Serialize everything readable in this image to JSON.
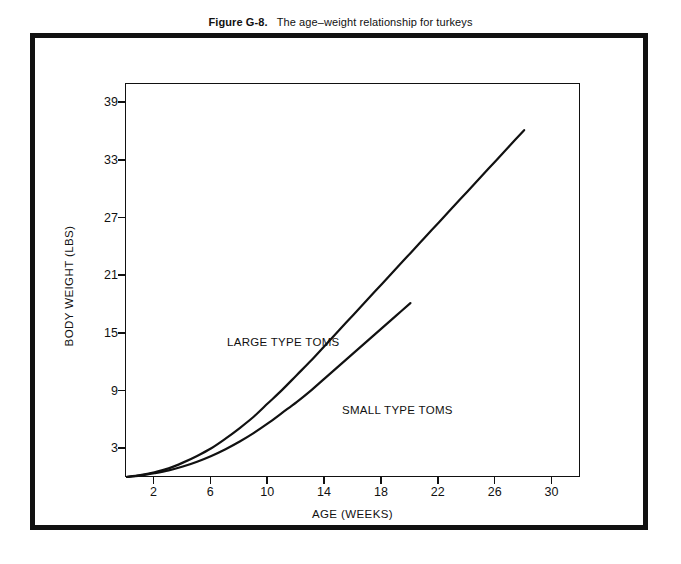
{
  "figure": {
    "number": "Figure G-8.",
    "caption": "The age–weight relationship for turkeys"
  },
  "chart_data": {
    "type": "line",
    "xlabel": "AGE (WEEKS)",
    "ylabel": "BODY WEIGHT (LBS)",
    "xlim": [
      0,
      32
    ],
    "ylim": [
      0,
      41
    ],
    "xticks": [
      2,
      6,
      10,
      14,
      18,
      22,
      26,
      30
    ],
    "yticks": [
      3,
      9,
      15,
      21,
      27,
      33,
      39
    ],
    "xtick_labels": [
      "2",
      "6",
      "10",
      "14",
      "18",
      "22",
      "26",
      "30"
    ],
    "ytick_labels": [
      "3",
      "9",
      "15",
      "21",
      "27",
      "33",
      "39"
    ],
    "grid": false,
    "legend": "inline-annotations",
    "line_color": "#111111",
    "background": "#ffffff",
    "series": [
      {
        "name": "LARGE TYPE TOMS",
        "annotation_label": "LARGE TYPE TOMS",
        "x": [
          0,
          1,
          2,
          3,
          4,
          5,
          6,
          7,
          8,
          9,
          10,
          11,
          12,
          13,
          14,
          15,
          16,
          17,
          18,
          19,
          20,
          21,
          22,
          23,
          24,
          25,
          26,
          27,
          28
        ],
        "values": [
          0.1,
          0.3,
          0.6,
          1.0,
          1.6,
          2.3,
          3.1,
          4.1,
          5.2,
          6.4,
          7.8,
          9.2,
          10.7,
          12.2,
          13.8,
          15.4,
          17.0,
          18.6,
          20.2,
          21.8,
          23.4,
          25.0,
          26.6,
          28.2,
          29.8,
          31.4,
          33.0,
          34.6,
          36.2
        ]
      },
      {
        "name": "SMALL TYPE TOMS",
        "annotation_label": "SMALL TYPE TOMS",
        "x": [
          0,
          1,
          2,
          3,
          4,
          5,
          6,
          7,
          8,
          9,
          10,
          11,
          12,
          13,
          14,
          15,
          16,
          17,
          18,
          19,
          20
        ],
        "values": [
          0.1,
          0.25,
          0.5,
          0.8,
          1.2,
          1.7,
          2.3,
          3.0,
          3.8,
          4.7,
          5.7,
          6.8,
          7.9,
          9.1,
          10.4,
          11.7,
          13.0,
          14.3,
          15.6,
          16.9,
          18.2
        ]
      }
    ]
  }
}
